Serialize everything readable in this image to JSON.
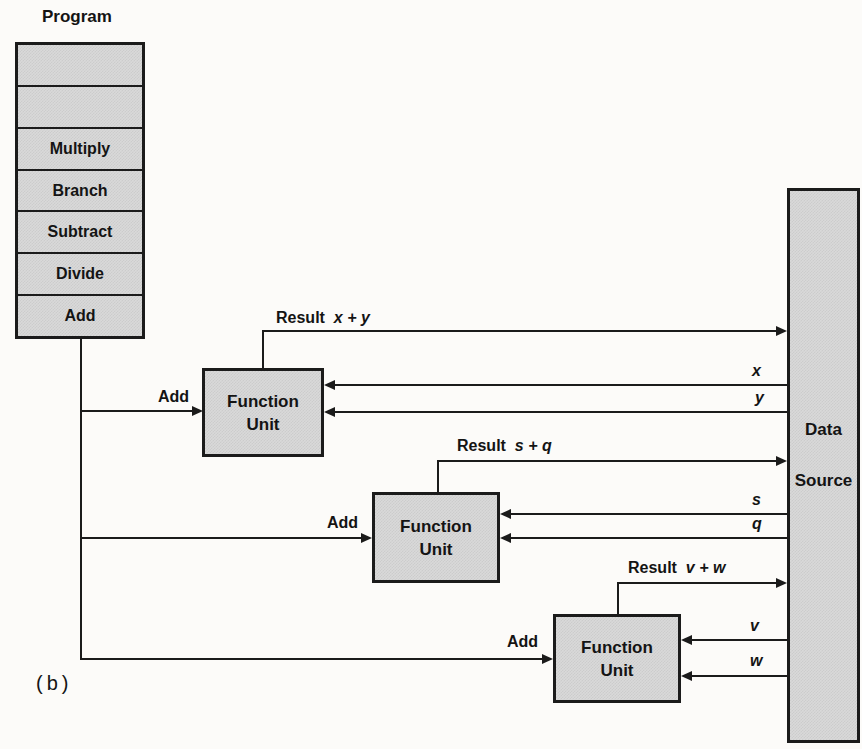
{
  "diagram": {
    "caption": "(b)",
    "colors": {
      "box_fill": "#d9d9d9",
      "line": "#1b1b1b",
      "background": "#fcfbf9"
    },
    "program": {
      "title": "Program",
      "cells": [
        "",
        "",
        "Multiply",
        "Branch",
        "Subtract",
        "Divide",
        "Add"
      ]
    },
    "data_source": {
      "line1": "Data",
      "line2": "Source"
    },
    "function_units": [
      {
        "line1": "Function",
        "line2": "Unit",
        "input_label": "Add",
        "result_prefix": "Result",
        "result_expr": "x + y",
        "operand1": "x",
        "operand2": "y"
      },
      {
        "line1": "Function",
        "line2": "Unit",
        "input_label": "Add",
        "result_prefix": "Result",
        "result_expr": "s + q",
        "operand1": "s",
        "operand2": "q"
      },
      {
        "line1": "Function",
        "line2": "Unit",
        "input_label": "Add",
        "result_prefix": "Result",
        "result_expr": "v + w",
        "operand1": "v",
        "operand2": "w"
      }
    ]
  }
}
